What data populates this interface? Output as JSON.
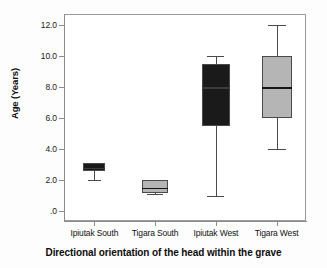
{
  "chart_data": {
    "type": "box",
    "title": "",
    "xlabel": "Directional orientation of the head within the grave",
    "ylabel": "Age (Years)",
    "ylim": [
      0,
      12.6
    ],
    "grid": false,
    "legend": "none",
    "categories": [
      "Ipiutak South",
      "Tigara South",
      "Ipiutak West",
      "Tigara West"
    ],
    "ytick_labels": [
      "12.0",
      "10.0",
      "8.0",
      "6.0",
      "4.0",
      "2.0",
      ".0"
    ],
    "ytick_values": [
      12.0,
      10.0,
      8.0,
      6.0,
      4.0,
      2.0,
      0.0
    ],
    "boxes": [
      {
        "category": "Ipiutak South",
        "whisker_low": 2.0,
        "q1": 2.55,
        "median": 2.8,
        "q3": 3.1,
        "whisker_high": 3.1,
        "fill": "#1a1a1a"
      },
      {
        "category": "Tigara South",
        "whisker_low": 1.1,
        "q1": 1.15,
        "median": 1.5,
        "q3": 2.0,
        "whisker_high": 2.0,
        "fill": "#b5b5b5"
      },
      {
        "category": "Ipiutak West",
        "whisker_low": 1.0,
        "q1": 5.5,
        "median": 8.0,
        "q3": 9.5,
        "whisker_high": 10.0,
        "fill": "#1a1a1a"
      },
      {
        "category": "Tigara West",
        "whisker_low": 4.0,
        "q1": 6.0,
        "median": 8.0,
        "q3": 10.0,
        "whisker_high": 12.0,
        "fill": "#b5b5b5"
      }
    ],
    "colors": {
      "dark_fill": "#1a1a1a",
      "light_fill": "#b5b5b5",
      "outline": "#4a4a4a",
      "axis": "#8d8d8d",
      "text": "#111111"
    }
  }
}
